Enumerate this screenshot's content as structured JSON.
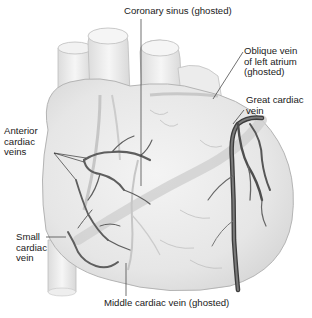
{
  "figure": {
    "colors": {
      "background": "#ffffff",
      "heart_fill": "#ececec",
      "heart_outline": "#b8b8b8",
      "vein_dark": "#5a5a5a",
      "vein_ghost": "#c4c4c4",
      "leader_line": "#333333",
      "text": "#1a1a1a"
    }
  },
  "labels": {
    "coronary_sinus": "Coronary sinus (ghosted)",
    "oblique_vein": "Oblique vein\nof left atrium\n(ghosted)",
    "great_cardiac_vein": "Great cardiac\nvein",
    "anterior_cardiac_veins": "Anterior\ncardiac\nveins",
    "small_cardiac_vein": "Small\ncardiac\nvein",
    "middle_cardiac_vein": "Middle cardiac vein (ghosted)"
  }
}
